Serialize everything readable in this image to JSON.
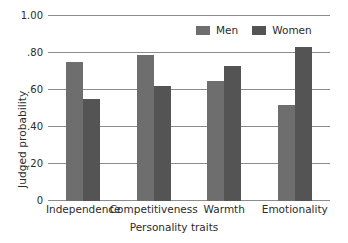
{
  "chart_data": {
    "type": "bar",
    "title": "",
    "xlabel": "Personality traits",
    "ylabel": "Judged probability",
    "categories": [
      "Independence",
      "Competitiveness",
      "Warmth",
      "Emotionality"
    ],
    "series": [
      {
        "name": "Men",
        "color": "#6e6e6e",
        "values": [
          0.75,
          0.79,
          0.65,
          0.52
        ]
      },
      {
        "name": "Women",
        "color": "#545454",
        "values": [
          0.55,
          0.62,
          0.73,
          0.83
        ]
      }
    ],
    "ylim": [
      0,
      1.0
    ],
    "yticks": [
      0,
      0.2,
      0.4,
      0.6,
      0.8,
      1.0
    ],
    "ytick_labels": [
      "0",
      ".20",
      ".40",
      ".60",
      ".80",
      "1.00"
    ],
    "grid": true,
    "legend_position": "top-right"
  }
}
